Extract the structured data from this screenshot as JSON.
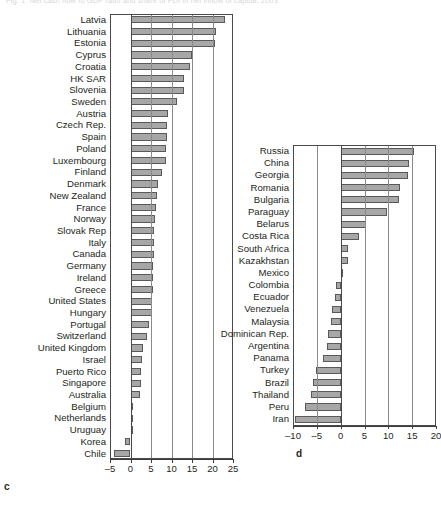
{
  "figure": {
    "cut_off_header": "Fig. 1. Net cash flow to GDP ratio and share of FDI in net inflow of capital, 2003",
    "panel_c_letter": "c",
    "panel_d_letter": "d"
  },
  "chart_data": [
    {
      "id": "panel-c",
      "type": "bar",
      "orientation": "horizontal",
      "title": "",
      "xlabel": "",
      "ylabel": "",
      "xlim": [
        -5,
        25
      ],
      "xticks": [
        -5,
        0,
        5,
        10,
        15,
        20,
        25
      ],
      "xticklabels": [
        "-5",
        "0",
        "5",
        "10",
        "15",
        "20",
        "25"
      ],
      "grid": true,
      "legend": "none",
      "bar_fill": "#a7a7a7",
      "bar_edge": "#595959",
      "categories": [
        "Latvia",
        "Lithuania",
        "Estonia",
        "Cyprus",
        "Croatia",
        "HK SAR",
        "Slovenia",
        "Sweden",
        "Austria",
        "Czech Rep.",
        "Spain",
        "Poland",
        "Luxembourg",
        "Finland",
        "Denmark",
        "New Zealand",
        "France",
        "Norway",
        "Slovak Rep",
        "Italy",
        "Canada",
        "Germany",
        "Ireland",
        "Greece",
        "United States",
        "Hungary",
        "Portugal",
        "Switzerland",
        "United Kingdom",
        "Israel",
        "Puerto Rico",
        "Singapore",
        "Australia",
        "Belgium",
        "Netherlands",
        "Uruguay",
        "Korea",
        "Chile"
      ],
      "values": [
        23.0,
        20.8,
        20.6,
        14.9,
        14.6,
        13.1,
        13.0,
        11.3,
        9.1,
        9.0,
        8.8,
        8.7,
        8.6,
        7.6,
        6.7,
        6.5,
        6.1,
        5.9,
        5.8,
        5.7,
        5.7,
        5.6,
        5.6,
        5.4,
        5.3,
        5.2,
        4.4,
        4.1,
        3.1,
        2.8,
        2.6,
        2.5,
        2.2,
        0.5,
        0.4,
        0.2,
        -1.4,
        -4.0
      ]
    },
    {
      "id": "panel-d",
      "type": "bar",
      "orientation": "horizontal",
      "title": "",
      "xlabel": "",
      "ylabel": "",
      "xlim": [
        -10,
        20
      ],
      "xticks": [
        -10,
        -5,
        0,
        5,
        10,
        15,
        20
      ],
      "xticklabels": [
        "-10",
        "-5",
        "0",
        "5",
        "10",
        "15",
        "20"
      ],
      "grid": true,
      "legend": "none",
      "bar_fill": "#a7a7a7",
      "bar_edge": "#595959",
      "categories": [
        "Russia",
        "China",
        "Georgia",
        "Romania",
        "Bulgaria",
        "Paraguay",
        "Belarus",
        "Costa Rica",
        "South Africa",
        "Kazakhstan",
        "Mexico",
        "Colombia",
        "Ecuador",
        "Venezuela",
        "Malaysia",
        "Dominican Rep.",
        "Argentina",
        "Panama",
        "Turkey",
        "Brazil",
        "Thailand",
        "Peru",
        "Iran"
      ],
      "values": [
        15.4,
        14.3,
        14.1,
        12.5,
        12.3,
        9.7,
        5.4,
        3.8,
        1.6,
        1.5,
        0.3,
        -0.9,
        -1.2,
        -1.9,
        -2.1,
        -2.6,
        -2.9,
        -3.7,
        -5.1,
        -5.7,
        -6.3,
        -7.4,
        -9.5
      ]
    }
  ]
}
